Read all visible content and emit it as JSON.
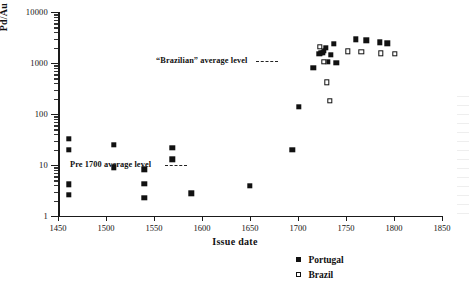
{
  "chart_data": {
    "type": "scatter",
    "title": "",
    "xlabel": "Issue date",
    "ylabel": "Pd/Au in ppm",
    "xlim": [
      1450,
      1850
    ],
    "ylim": [
      1,
      10000
    ],
    "yscale": "log",
    "xscale": "linear",
    "grid": false,
    "xticks": [
      1450,
      1500,
      1550,
      1600,
      1650,
      1700,
      1750,
      1800,
      1850
    ],
    "xticklabels": [
      "1450",
      "1500",
      "1550",
      "1600",
      "1650",
      "1700",
      "1750",
      "1800",
      "1850"
    ],
    "yticks": [
      1,
      10,
      100,
      1000,
      10000
    ],
    "yticklabels": [
      "1",
      "10",
      "100",
      "1000",
      "10000"
    ],
    "legend_position": "below-right",
    "series": [
      {
        "name": "Portugal",
        "marker": "filled-square",
        "color": "#111111",
        "points": [
          [
            1461,
            33
          ],
          [
            1461,
            20
          ],
          [
            1461,
            4.2
          ],
          [
            1461,
            2.6
          ],
          [
            1508,
            25
          ],
          [
            1508,
            9.0
          ],
          [
            1540,
            8.2
          ],
          [
            1540,
            4.3
          ],
          [
            1540,
            2.3
          ],
          [
            1569,
            22
          ],
          [
            1569,
            13
          ],
          [
            1589,
            2.8
          ],
          [
            1650,
            3.9
          ],
          [
            1694,
            20
          ],
          [
            1701,
            140
          ],
          [
            1716,
            800
          ],
          [
            1722,
            1500
          ],
          [
            1724,
            1600
          ],
          [
            1726,
            1600
          ],
          [
            1727,
            1750
          ],
          [
            1729,
            2000
          ],
          [
            1731,
            1050
          ],
          [
            1734,
            1450
          ],
          [
            1737,
            2350
          ],
          [
            1740,
            1020
          ],
          [
            1760,
            2900
          ],
          [
            1771,
            2800
          ],
          [
            1785,
            2550
          ],
          [
            1793,
            2450
          ]
        ]
      },
      {
        "name": "Brazil",
        "marker": "open-square",
        "color": "#111111",
        "points": [
          [
            1723,
            2100
          ],
          [
            1727,
            1050
          ],
          [
            1730,
            420
          ],
          [
            1733,
            180
          ],
          [
            1752,
            1700
          ],
          [
            1766,
            1650
          ],
          [
            1786,
            1550
          ],
          [
            1801,
            1500
          ]
        ]
      }
    ],
    "annotations": [
      {
        "text": "“Brazilian” average level",
        "leader": "dashed",
        "near_value": 1200
      },
      {
        "text": "Pre 1700 average level",
        "leader": "dashed",
        "near_value": 15
      }
    ]
  },
  "legend": {
    "items": [
      {
        "label": "Portugal",
        "marker": "filled-square"
      },
      {
        "label": "Brazil",
        "marker": "open-square"
      }
    ]
  }
}
